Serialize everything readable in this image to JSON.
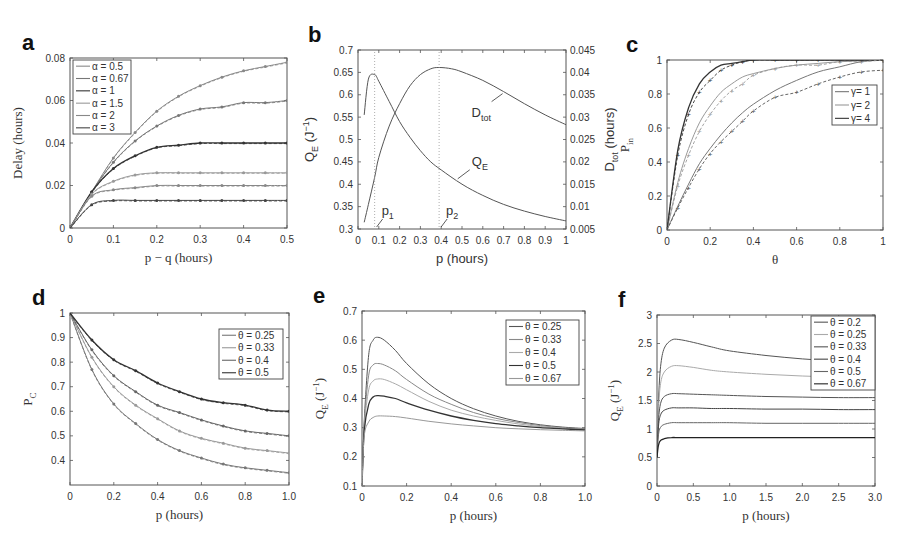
{
  "figure": {
    "panels": [
      "a",
      "b",
      "c",
      "d",
      "e",
      "f"
    ]
  },
  "chart_data": [
    {
      "id": "a",
      "type": "line",
      "panel_label": "a",
      "xlabel": "p − q (hours)",
      "ylabel": "Delay (hours)",
      "xlim": [
        0,
        0.5
      ],
      "ylim": [
        0,
        0.08
      ],
      "xticks": [
        0,
        0.1,
        0.2,
        0.3,
        0.4,
        0.5
      ],
      "xtick_labels": [
        "0",
        "0.1",
        "0.2",
        "0.3",
        "0.4",
        "0.5"
      ],
      "yticks": [
        0,
        0.02,
        0.04,
        0.06,
        0.08
      ],
      "ytick_labels": [
        "0",
        "0.02",
        "0.04",
        "0.06",
        "0.08"
      ],
      "legend_position": "upper left",
      "x": [
        0,
        0.05,
        0.1,
        0.15,
        0.2,
        0.25,
        0.3,
        0.35,
        0.4,
        0.45,
        0.5
      ],
      "series": [
        {
          "name": "α = 0.5",
          "color": "#888888",
          "values": [
            0,
            0.017,
            0.033,
            0.045,
            0.055,
            0.062,
            0.067,
            0.071,
            0.074,
            0.076,
            0.078
          ]
        },
        {
          "name": "α = 0.67",
          "color": "#777777",
          "values": [
            0,
            0.017,
            0.031,
            0.041,
            0.048,
            0.053,
            0.056,
            0.057,
            0.059,
            0.059,
            0.06
          ]
        },
        {
          "name": "α = 1",
          "color": "#333333",
          "values": [
            0,
            0.017,
            0.028,
            0.034,
            0.038,
            0.039,
            0.04,
            0.04,
            0.04,
            0.04,
            0.04
          ]
        },
        {
          "name": "α = 1.5",
          "color": "#999999",
          "values": [
            0,
            0.016,
            0.022,
            0.025,
            0.026,
            0.026,
            0.026,
            0.026,
            0.026,
            0.026,
            0.026
          ]
        },
        {
          "name": "α = 2",
          "color": "#888888",
          "values": [
            0,
            0.015,
            0.018,
            0.019,
            0.02,
            0.02,
            0.02,
            0.02,
            0.02,
            0.02,
            0.02
          ]
        },
        {
          "name": "α = 3",
          "color": "#444444",
          "values": [
            0,
            0.011,
            0.013,
            0.013,
            0.013,
            0.013,
            0.013,
            0.013,
            0.013,
            0.013,
            0.013
          ]
        }
      ]
    },
    {
      "id": "b",
      "type": "line",
      "panel_label": "b",
      "xlabel": "p (hours)",
      "ylabel": "Q_E (J^-1)",
      "ylabel_right": "D_tot (hours)",
      "xlim": [
        0,
        1
      ],
      "ylim": [
        0.3,
        0.7
      ],
      "ylim_right": [
        0.005,
        0.045
      ],
      "xticks": [
        0,
        0.1,
        0.2,
        0.3,
        0.4,
        0.5,
        0.6,
        0.7,
        0.8,
        0.9,
        1
      ],
      "xtick_labels": [
        "0",
        "0.1",
        "0.2",
        "0.3",
        "0.4",
        "0.5",
        "0.6",
        "0.7",
        "0.8",
        "0.9",
        "1"
      ],
      "yticks": [
        0.3,
        0.35,
        0.4,
        0.45,
        0.5,
        0.55,
        0.6,
        0.65,
        0.7
      ],
      "ytick_labels": [
        "0.3",
        "0.35",
        "0.4",
        "0.45",
        "0.5",
        "0.55",
        "0.6",
        "0.65",
        "0.7"
      ],
      "yticks_right": [
        0.005,
        0.01,
        0.015,
        0.02,
        0.025,
        0.03,
        0.035,
        0.04,
        0.045
      ],
      "ytick_labels_right": [
        "0.005",
        "0.01",
        "0.015",
        "0.02",
        "0.025",
        "0.03",
        "0.035",
        "0.04",
        "0.045"
      ],
      "series": [
        {
          "name": "Q_E",
          "axis": "left",
          "color": "#555555",
          "x": [
            0.03,
            0.05,
            0.08,
            0.1,
            0.15,
            0.2,
            0.25,
            0.3,
            0.35,
            0.4,
            0.5,
            0.6,
            0.7,
            0.8,
            0.9,
            1.0
          ],
          "values": [
            0.555,
            0.635,
            0.645,
            0.63,
            0.585,
            0.54,
            0.505,
            0.475,
            0.45,
            0.432,
            0.4,
            0.375,
            0.355,
            0.34,
            0.328,
            0.318
          ]
        },
        {
          "name": "D_tot",
          "axis": "right",
          "color": "#555555",
          "x": [
            0.03,
            0.05,
            0.08,
            0.1,
            0.15,
            0.2,
            0.25,
            0.3,
            0.35,
            0.39,
            0.45,
            0.5,
            0.6,
            0.7,
            0.8,
            0.9,
            1.0
          ],
          "values": [
            0.0065,
            0.0105,
            0.0165,
            0.021,
            0.028,
            0.033,
            0.037,
            0.0395,
            0.0408,
            0.0411,
            0.0408,
            0.0401,
            0.0382,
            0.0357,
            0.033,
            0.0305,
            0.0283
          ]
        }
      ],
      "annotations": [
        {
          "text": "p1",
          "x": 0.08,
          "note": "vertical dotted line at Q_E peak"
        },
        {
          "text": "p2",
          "x": 0.39,
          "note": "vertical dotted line at D_tot peak"
        },
        {
          "text": "D_tot",
          "arrow_to": [
            0.7,
            0.0357
          ]
        },
        {
          "text": "Q_E",
          "arrow_to": [
            0.47,
            0.41
          ]
        }
      ]
    },
    {
      "id": "c",
      "type": "line",
      "panel_label": "c",
      "xlabel": "θ",
      "ylabel": "P_in",
      "xlim": [
        0,
        1
      ],
      "ylim": [
        0,
        1
      ],
      "xticks": [
        0,
        0.2,
        0.4,
        0.6,
        0.8,
        1
      ],
      "xtick_labels": [
        "0",
        "0.2",
        "0.4",
        "0.6",
        "0.8",
        "1"
      ],
      "yticks": [
        0,
        0.2,
        0.4,
        0.6,
        0.8,
        1
      ],
      "ytick_labels": [
        "0",
        "0.2",
        "0.4",
        "0.6",
        "0.8",
        "1"
      ],
      "legend_position": "right middle",
      "x": [
        0,
        0.05,
        0.1,
        0.15,
        0.2,
        0.25,
        0.3,
        0.35,
        0.4,
        0.5,
        0.6,
        0.7,
        0.8,
        0.9,
        1.0
      ],
      "series": [
        {
          "name": "γ= 1",
          "color": "#777777",
          "values": [
            0,
            0.14,
            0.27,
            0.39,
            0.48,
            0.56,
            0.63,
            0.69,
            0.74,
            0.82,
            0.88,
            0.93,
            0.96,
            0.99,
            1.0
          ]
        },
        {
          "name": "γ= 2",
          "color": "#999999",
          "values": [
            0,
            0.28,
            0.48,
            0.63,
            0.73,
            0.81,
            0.86,
            0.9,
            0.92,
            0.95,
            0.97,
            0.98,
            0.99,
            0.995,
            1.0
          ]
        },
        {
          "name": "γ= 4",
          "color": "#333333",
          "values": [
            0,
            0.47,
            0.72,
            0.86,
            0.93,
            0.97,
            0.98,
            0.99,
            1.0,
            1.0,
            1.0,
            1.0,
            1.0,
            1.0,
            1.0
          ]
        }
      ],
      "series_sim": [
        {
          "name": "γ= 1 (sim)",
          "color": "#555555",
          "values": [
            0,
            0.13,
            0.25,
            0.36,
            0.45,
            0.52,
            0.58,
            0.64,
            0.7,
            0.78,
            0.81,
            0.86,
            0.9,
            0.93,
            0.94
          ]
        },
        {
          "name": "γ= 2 (sim)",
          "color": "#999999",
          "values": [
            0,
            0.26,
            0.44,
            0.58,
            0.68,
            0.76,
            0.82,
            0.86,
            0.91,
            0.95,
            0.97,
            0.97,
            0.99,
            0.99,
            1.0
          ]
        },
        {
          "name": "γ= 4 (sim)",
          "color": "#333333",
          "values": [
            0,
            0.44,
            0.68,
            0.81,
            0.88,
            0.94,
            0.97,
            0.99,
            1.0,
            1.0,
            1.0,
            1.0,
            1.0,
            1.0,
            1.0
          ]
        }
      ]
    },
    {
      "id": "d",
      "type": "line",
      "panel_label": "d",
      "xlabel": "p (hours)",
      "ylabel": "P_C",
      "xlim": [
        0,
        1.0
      ],
      "ylim": [
        0.3,
        1.0
      ],
      "xticks": [
        0,
        0.2,
        0.4,
        0.6,
        0.8,
        1.0
      ],
      "xtick_labels": [
        "0",
        "0.2",
        "0.4",
        "0.6",
        "0.8",
        "1.0"
      ],
      "yticks": [
        0.4,
        0.5,
        0.6,
        0.7,
        0.8,
        0.9,
        1.0
      ],
      "ytick_labels": [
        "0.4",
        "0.5",
        "0.6",
        "0.7",
        "0.8",
        "0.9",
        "1"
      ],
      "legend_position": "upper right",
      "x": [
        0,
        0.1,
        0.2,
        0.3,
        0.4,
        0.5,
        0.6,
        0.7,
        0.8,
        0.9,
        1.0
      ],
      "series": [
        {
          "name": "θ = 0.25",
          "color": "#777777",
          "values": [
            1.0,
            0.77,
            0.63,
            0.55,
            0.485,
            0.44,
            0.41,
            0.385,
            0.37,
            0.36,
            0.35
          ]
        },
        {
          "name": "θ = 0.33",
          "color": "#999999",
          "values": [
            1.0,
            0.82,
            0.7,
            0.625,
            0.57,
            0.52,
            0.49,
            0.47,
            0.45,
            0.44,
            0.43
          ]
        },
        {
          "name": "θ = 0.4",
          "color": "#666666",
          "values": [
            1.0,
            0.85,
            0.745,
            0.68,
            0.625,
            0.595,
            0.565,
            0.54,
            0.52,
            0.51,
            0.5
          ]
        },
        {
          "name": "θ = 0.5",
          "color": "#333333",
          "values": [
            1.0,
            0.89,
            0.81,
            0.765,
            0.715,
            0.68,
            0.65,
            0.635,
            0.625,
            0.605,
            0.6
          ]
        }
      ]
    },
    {
      "id": "e",
      "type": "line",
      "panel_label": "e",
      "xlabel": "p (hours)",
      "ylabel": "Q_E (J^-1)",
      "xlim": [
        0,
        1.0
      ],
      "ylim": [
        0.1,
        0.7
      ],
      "xticks": [
        0,
        0.2,
        0.4,
        0.6,
        0.8,
        1.0
      ],
      "xtick_labels": [
        "0",
        "0.2",
        "0.4",
        "0.6",
        "0.8",
        "1.0"
      ],
      "yticks": [
        0.1,
        0.2,
        0.3,
        0.4,
        0.5,
        0.6,
        0.7
      ],
      "ytick_labels": [
        "0.1",
        "0.2",
        "0.3",
        "0.4",
        "0.5",
        "0.6",
        "0.7"
      ],
      "legend_position": "upper right",
      "x": [
        0,
        0.01,
        0.03,
        0.05,
        0.07,
        0.1,
        0.15,
        0.2,
        0.3,
        0.4,
        0.5,
        0.6,
        0.7,
        0.8,
        0.9,
        1.0
      ],
      "series": [
        {
          "name": "θ = 0.25",
          "color": "#555555",
          "values": [
            0.1,
            0.32,
            0.55,
            0.6,
            0.61,
            0.6,
            0.565,
            0.52,
            0.45,
            0.4,
            0.365,
            0.34,
            0.322,
            0.31,
            0.302,
            0.297
          ]
        },
        {
          "name": "θ = 0.33",
          "color": "#888888",
          "values": [
            0.1,
            0.31,
            0.48,
            0.515,
            0.52,
            0.515,
            0.495,
            0.465,
            0.415,
            0.38,
            0.352,
            0.332,
            0.318,
            0.307,
            0.3,
            0.295
          ]
        },
        {
          "name": "θ = 0.4",
          "color": "#aaaaaa",
          "values": [
            0.1,
            0.3,
            0.43,
            0.46,
            0.467,
            0.465,
            0.45,
            0.43,
            0.39,
            0.36,
            0.34,
            0.325,
            0.313,
            0.304,
            0.298,
            0.294
          ]
        },
        {
          "name": "θ = 0.5",
          "color": "#333333",
          "values": [
            0.1,
            0.29,
            0.38,
            0.405,
            0.41,
            0.408,
            0.4,
            0.385,
            0.36,
            0.34,
            0.325,
            0.314,
            0.306,
            0.3,
            0.296,
            0.292
          ]
        },
        {
          "name": "θ = 0.67",
          "color": "#999999",
          "values": [
            0.1,
            0.27,
            0.32,
            0.335,
            0.34,
            0.34,
            0.338,
            0.333,
            0.322,
            0.313,
            0.306,
            0.3,
            0.296,
            0.293,
            0.291,
            0.289
          ]
        }
      ]
    },
    {
      "id": "f",
      "type": "line",
      "panel_label": "f",
      "xlabel": "p (hours)",
      "ylabel": "Q_E (J^-1)",
      "xlim": [
        0,
        3.0
      ],
      "ylim": [
        0,
        3
      ],
      "xticks": [
        0,
        0.5,
        1.0,
        1.5,
        2.0,
        2.5,
        3.0
      ],
      "xtick_labels": [
        "0",
        "0.5",
        "1.0",
        "1.5",
        "2.0",
        "2.5",
        "3.0"
      ],
      "yticks": [
        0,
        0.5,
        1,
        1.5,
        2,
        2.5,
        3
      ],
      "ytick_labels": [
        "0",
        "0.5",
        "1",
        "1.5",
        "2",
        "2.5",
        "3"
      ],
      "legend_position": "upper right",
      "x": [
        0,
        0.02,
        0.05,
        0.1,
        0.2,
        0.3,
        0.5,
        0.75,
        1.0,
        1.5,
        2.0,
        2.5,
        3.0
      ],
      "series": [
        {
          "name": "θ = 0.2",
          "color": "#555555",
          "values": [
            0.5,
            1.5,
            2.1,
            2.42,
            2.56,
            2.57,
            2.52,
            2.44,
            2.37,
            2.29,
            2.23,
            2.19,
            2.16
          ]
        },
        {
          "name": "θ = 0.25",
          "color": "#aaaaaa",
          "values": [
            0.5,
            1.35,
            1.8,
            2.0,
            2.1,
            2.11,
            2.08,
            2.03,
            2.0,
            1.96,
            1.93,
            1.91,
            1.9
          ]
        },
        {
          "name": "θ = 0.33",
          "color": "#555555",
          "values": [
            0.5,
            1.15,
            1.45,
            1.57,
            1.62,
            1.62,
            1.61,
            1.6,
            1.59,
            1.57,
            1.56,
            1.55,
            1.55
          ]
        },
        {
          "name": "θ = 0.4",
          "color": "#444444",
          "values": [
            0.5,
            1.05,
            1.25,
            1.33,
            1.37,
            1.37,
            1.37,
            1.36,
            1.36,
            1.35,
            1.35,
            1.34,
            1.34
          ]
        },
        {
          "name": "θ = 0.5",
          "color": "#666666",
          "values": [
            0.5,
            0.9,
            1.03,
            1.08,
            1.11,
            1.11,
            1.11,
            1.11,
            1.11,
            1.1,
            1.1,
            1.1,
            1.1
          ]
        },
        {
          "name": "θ = 0.67",
          "color": "#222222",
          "values": [
            0.5,
            0.72,
            0.8,
            0.83,
            0.85,
            0.85,
            0.85,
            0.85,
            0.85,
            0.85,
            0.85,
            0.85,
            0.85
          ]
        }
      ]
    }
  ]
}
